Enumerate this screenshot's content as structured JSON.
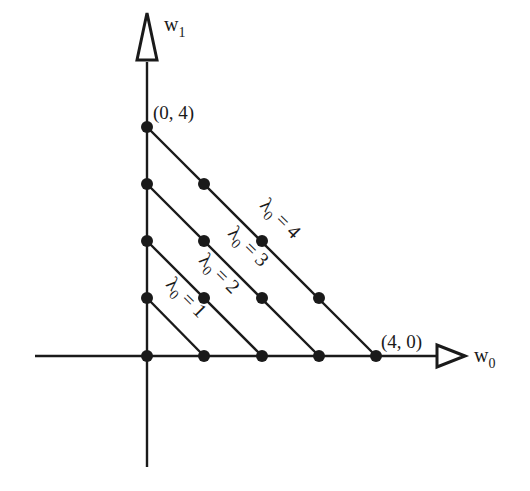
{
  "diagram": {
    "type": "lattice-diagram",
    "axes": {
      "horizontal": {
        "label": "w",
        "subscript": "0"
      },
      "vertical": {
        "label": "w",
        "subscript": "1"
      }
    },
    "point_labels": [
      {
        "text": "(0, 4)",
        "coord": [
          0,
          4
        ]
      },
      {
        "text": "(4, 0)",
        "coord": [
          4,
          0
        ]
      }
    ],
    "lines": [
      {
        "lambda": "λ",
        "subscript": "0",
        "equals": " = ",
        "value": "1",
        "from": [
          1,
          0
        ],
        "to": [
          0,
          1
        ]
      },
      {
        "lambda": "λ",
        "subscript": "0",
        "equals": " = ",
        "value": "2",
        "from": [
          2,
          0
        ],
        "to": [
          0,
          2
        ]
      },
      {
        "lambda": "λ",
        "subscript": "0",
        "equals": " = ",
        "value": "3",
        "from": [
          3,
          0
        ],
        "to": [
          0,
          3
        ]
      },
      {
        "lambda": "λ",
        "subscript": "0",
        "equals": " = ",
        "value": "4",
        "from": [
          4,
          0
        ],
        "to": [
          0,
          4
        ]
      }
    ],
    "points": [
      [
        0,
        0
      ],
      [
        1,
        0
      ],
      [
        2,
        0
      ],
      [
        3,
        0
      ],
      [
        4,
        0
      ],
      [
        0,
        1
      ],
      [
        1,
        1
      ],
      [
        2,
        1
      ],
      [
        3,
        1
      ],
      [
        0,
        2
      ],
      [
        1,
        2
      ],
      [
        2,
        2
      ],
      [
        0,
        3
      ],
      [
        1,
        3
      ],
      [
        0,
        4
      ]
    ],
    "colors": {
      "ink": "#1a1a1a",
      "background": "#ffffff"
    }
  }
}
